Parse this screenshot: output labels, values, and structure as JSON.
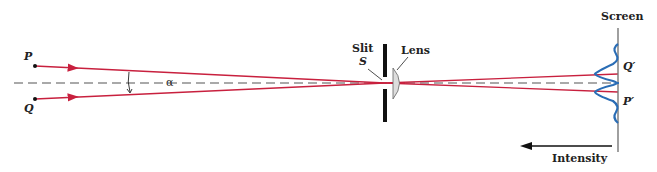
{
  "labels": {
    "p": "P",
    "q": "Q",
    "alpha": "α",
    "slit": "Slit",
    "slit_symbol": "S",
    "lens": "Lens",
    "screen": "Screen",
    "q_prime": "Q′",
    "p_prime": "P′",
    "intensity": "Intensity"
  },
  "colors": {
    "ray": "#c8203e",
    "axis": "#555555",
    "intensity_curve": "#2a6db5",
    "screen": "#777777",
    "slit": "#111111",
    "lens_fill": "#dddddd"
  }
}
